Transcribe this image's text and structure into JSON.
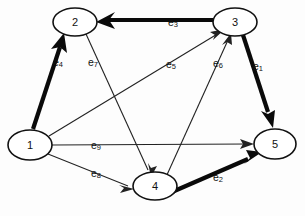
{
  "diagram": {
    "type": "directed-graph",
    "width": 305,
    "height": 216,
    "background_color": "#fdfdfd",
    "node_fill": "#ffffff",
    "node_stroke": "#111111",
    "edge_color_thin": "#222222",
    "edge_color_thick": "#0a0a0a"
  },
  "nodes": [
    {
      "id": "1",
      "label": "1",
      "x": 30,
      "y": 145,
      "rx": 22,
      "ry": 15
    },
    {
      "id": "2",
      "label": "2",
      "x": 75,
      "y": 22,
      "rx": 22,
      "ry": 14
    },
    {
      "id": "3",
      "label": "3",
      "x": 235,
      "y": 22,
      "rx": 22,
      "ry": 14
    },
    {
      "id": "4",
      "label": "4",
      "x": 155,
      "y": 186,
      "rx": 22,
      "ry": 14
    },
    {
      "id": "5",
      "label": "5",
      "x": 275,
      "y": 144,
      "rx": 21,
      "ry": 15
    }
  ],
  "edges": [
    {
      "id": "e1",
      "label": "e",
      "sub": "1",
      "from": "3",
      "to": "5",
      "weight": "thick",
      "label_x": 253,
      "label_y": 66
    },
    {
      "id": "e2",
      "label": "e",
      "sub": "2",
      "from": "4",
      "to": "5",
      "weight": "thick",
      "label_x": 213,
      "label_y": 177
    },
    {
      "id": "e3",
      "label": "e",
      "sub": "3",
      "from": "3",
      "to": "2",
      "weight": "thick",
      "label_x": 168,
      "label_y": 22
    },
    {
      "id": "e4",
      "label": "e",
      "sub": "4",
      "from": "1",
      "to": "2",
      "weight": "thick",
      "label_x": 53,
      "label_y": 62
    },
    {
      "id": "e5",
      "label": "e",
      "sub": "5",
      "from": "1",
      "to": "3",
      "weight": "thin",
      "label_x": 166,
      "label_y": 64
    },
    {
      "id": "e6",
      "label": "e",
      "sub": "6",
      "from": "4",
      "to": "3",
      "weight": "thin",
      "label_x": 213,
      "label_y": 63
    },
    {
      "id": "e7",
      "label": "e",
      "sub": "7",
      "from": "2",
      "to": "4",
      "weight": "thin",
      "label_x": 88,
      "label_y": 62
    },
    {
      "id": "e8",
      "label": "e",
      "sub": "8",
      "from": "1",
      "to": "4",
      "weight": "thin",
      "label_x": 91,
      "label_y": 173
    },
    {
      "id": "e9",
      "label": "e",
      "sub": "9",
      "from": "1",
      "to": "5",
      "weight": "thin",
      "label_x": 91,
      "label_y": 145
    }
  ]
}
